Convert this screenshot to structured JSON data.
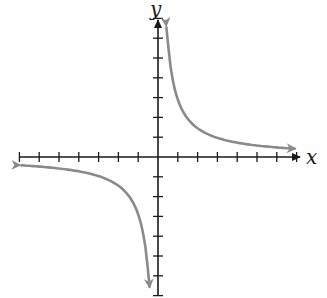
{
  "chart_data": {
    "type": "line",
    "title": "",
    "xlabel": "x",
    "ylabel": "y",
    "grid": false,
    "legend": null,
    "x_ticks": [
      -7,
      -6,
      -5,
      -4,
      -3,
      -2,
      -1,
      1,
      2,
      3,
      4,
      5,
      6,
      7
    ],
    "y_ticks": [
      -7,
      -6,
      -5,
      -4,
      -3,
      -2,
      -1,
      1,
      2,
      3,
      4,
      5,
      6,
      7
    ],
    "tick_labels_shown": false,
    "xlim": [
      -7,
      7
    ],
    "ylim": [
      -7,
      7
    ],
    "series": [
      {
        "name": "upper branch (quadrant I)",
        "x": [
          0.35,
          0.5,
          0.75,
          1,
          1.5,
          2,
          3,
          4,
          5,
          6,
          6.9
        ],
        "y": [
          6.5,
          5.0,
          3.6,
          2.9,
          2.0,
          1.5,
          1.0,
          0.75,
          0.6,
          0.5,
          0.42
        ]
      },
      {
        "name": "lower branch (quadrant III)",
        "x": [
          -6.9,
          -6,
          -5,
          -4,
          -3,
          -2,
          -1.5,
          -1,
          -0.75,
          -0.5,
          -0.35
        ],
        "y": [
          -0.42,
          -0.5,
          -0.6,
          -0.75,
          -1.0,
          -1.5,
          -2.0,
          -2.9,
          -3.6,
          -5.0,
          -6.5
        ]
      }
    ],
    "colors": {
      "axes": "#1a1a1a",
      "curve": "#8a8a8a"
    }
  }
}
